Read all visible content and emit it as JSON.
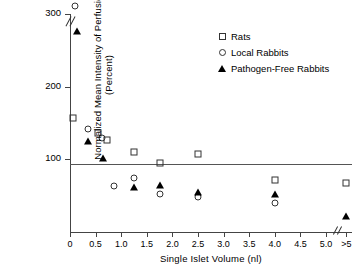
{
  "chart_data": {
    "type": "scatter",
    "title": "",
    "xlabel": "Single Islet Volume (nl)",
    "ylabel": "Normalized Mean Intensity of Perfusion (Percent)",
    "xlim": [
      0.0,
      5.0
    ],
    "ylim": [
      0,
      300
    ],
    "xticks": [
      "0",
      "0.5",
      "1.0",
      "1.5",
      "2.0",
      "2.5",
      "3.0",
      "3.5",
      "4.0",
      "4.5",
      "5.0",
      ">5"
    ],
    "xtick_values": [
      0.0,
      0.5,
      1.0,
      1.5,
      2.0,
      2.5,
      3.0,
      3.5,
      4.0,
      4.5,
      5.0,
      5.4
    ],
    "yticks": [
      "100",
      "200",
      "300"
    ],
    "ytick_values": [
      100,
      200,
      300
    ],
    "grid": false,
    "legend_position": "top-right",
    "axis_breaks": {
      "y_break_above": 300,
      "x_break_before": ">5"
    },
    "reference_lines": [
      {
        "axis": "y",
        "value": 100,
        "label": ""
      }
    ],
    "series": [
      {
        "name": "Rats",
        "marker": "open-square",
        "color": "#333333",
        "points": [
          {
            "x": 0.05,
            "y": 157
          },
          {
            "x": 0.55,
            "y": 136
          },
          {
            "x": 0.72,
            "y": 127
          },
          {
            "x": 1.25,
            "y": 110
          },
          {
            "x": 1.75,
            "y": 95
          },
          {
            "x": 2.5,
            "y": 108
          },
          {
            "x": 4.0,
            "y": 72
          },
          {
            "x": 5.4,
            "y": 68
          }
        ]
      },
      {
        "name": "Local Rabbits",
        "marker": "open-circle",
        "color": "#333333",
        "points": [
          {
            "x": 0.1,
            "y": 310,
            "above_break": true
          },
          {
            "x": 0.35,
            "y": 142
          },
          {
            "x": 0.62,
            "y": 130
          },
          {
            "x": 0.85,
            "y": 63
          },
          {
            "x": 1.25,
            "y": 75
          },
          {
            "x": 1.75,
            "y": 52
          },
          {
            "x": 2.5,
            "y": 48
          },
          {
            "x": 4.0,
            "y": 40
          }
        ]
      },
      {
        "name": "Pathogen-Free Rabbits",
        "marker": "filled-triangle",
        "color": "#000000",
        "points": [
          {
            "x": 0.14,
            "y": 277
          },
          {
            "x": 0.35,
            "y": 125
          },
          {
            "x": 0.65,
            "y": 102
          },
          {
            "x": 1.25,
            "y": 62
          },
          {
            "x": 1.75,
            "y": 65
          },
          {
            "x": 2.5,
            "y": 55
          },
          {
            "x": 4.0,
            "y": 52
          },
          {
            "x": 5.4,
            "y": 22
          }
        ]
      }
    ]
  },
  "legend": {
    "entries": [
      {
        "label": "Rats",
        "marker": "open-square"
      },
      {
        "label": "Local Rabbits",
        "marker": "open-circle"
      },
      {
        "label": "Pathogen-Free Rabbits",
        "marker": "filled-triangle"
      }
    ]
  }
}
